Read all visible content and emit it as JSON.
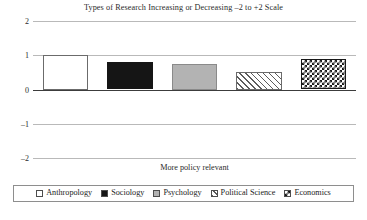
{
  "chart_data": {
    "type": "bar",
    "title": "Types of Research Increasing or Decreasing –2 to +2 Scale",
    "xlabel": "More policy relevant",
    "ylabel": "",
    "categories": [
      "Anthropology",
      "Sociology",
      "Psychology",
      "Political Science",
      "Economics"
    ],
    "values": [
      1.0,
      0.8,
      0.75,
      0.5,
      0.9
    ],
    "ylim": [
      -2,
      2
    ],
    "yticks": [
      2,
      1,
      0,
      -1,
      -2
    ],
    "ytick_labels": [
      "2",
      "1",
      "0",
      "–1",
      "–2"
    ],
    "grid": true,
    "legend_position": "bottom",
    "series": [
      {
        "name": "Anthropology",
        "value": 1.0,
        "pattern": "dotted",
        "swatch_class": "fill-dotted"
      },
      {
        "name": "Sociology",
        "value": 0.8,
        "pattern": "solid-black",
        "swatch_class": "fill-solid-black"
      },
      {
        "name": "Psychology",
        "value": 0.75,
        "pattern": "solid-gray",
        "swatch_class": "fill-gray"
      },
      {
        "name": "Political Science",
        "value": 0.5,
        "pattern": "diagonal-hatch",
        "swatch_class": "fill-diagonal"
      },
      {
        "name": "Economics",
        "value": 0.9,
        "pattern": "checkerboard",
        "swatch_class": "fill-checker"
      }
    ],
    "colors": {
      "gridline": "#b9b9b9",
      "zero_line": "#3c3c3c",
      "bar_border": "#6b6b6b",
      "text": "#2b2b2b",
      "black_fill": "#151515",
      "gray_fill": "#b3b3b3",
      "background": "#ffffff"
    }
  }
}
